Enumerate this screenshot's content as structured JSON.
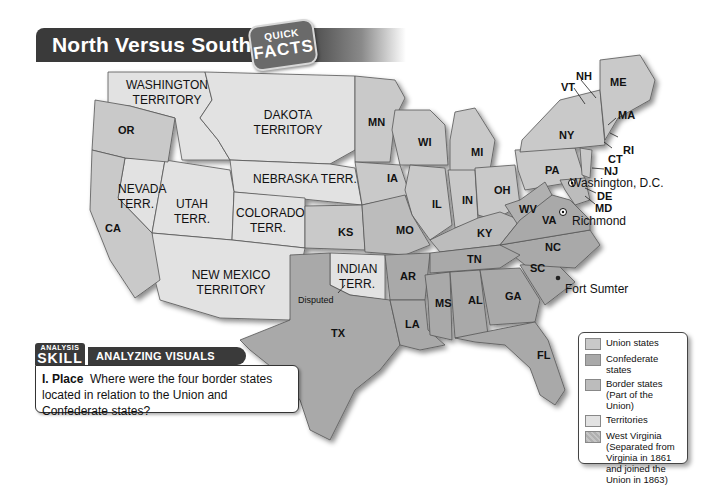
{
  "header": {
    "title": "North Versus South",
    "badge_top": "QUICK",
    "badge_bottom": "FACTS"
  },
  "colors": {
    "union": "#c9c9c9",
    "confederate": "#a9a9a9",
    "border_states": "#bcbcbc",
    "territories": "#e2e2e2",
    "west_virginia": "#b0b0b0",
    "title_bar": "#3a3a3a"
  },
  "map": {
    "territories": [
      {
        "label_line1": "WASHINGTON",
        "label_line2": "TERRITORY"
      },
      {
        "label_line1": "DAKOTA",
        "label_line2": "TERRITORY"
      },
      {
        "label_line1": "NEBRASKA TERR.",
        "label_line2": ""
      },
      {
        "label_line1": "NEVADA",
        "label_line2": "TERR."
      },
      {
        "label_line1": "UTAH",
        "label_line2": "TERR."
      },
      {
        "label_line1": "COLORADO",
        "label_line2": "TERR."
      },
      {
        "label_line1": "NEW MEXICO",
        "label_line2": "TERRITORY"
      },
      {
        "label_line1": "INDIAN",
        "label_line2": "TERR."
      }
    ],
    "states": {
      "OR": "OR",
      "CA": "CA",
      "MN": "MN",
      "WI": "WI",
      "MI": "MI",
      "IA": "IA",
      "KS": "KS",
      "MO": "MO",
      "IL": "IL",
      "IN": "IN",
      "OH": "OH",
      "PA": "PA",
      "NY": "NY",
      "KY": "KY",
      "WV": "WV",
      "VA": "VA",
      "NC": "NC",
      "TN": "TN",
      "SC": "SC",
      "GA": "GA",
      "AL": "AL",
      "MS": "MS",
      "AR": "AR",
      "LA": "LA",
      "TX": "TX",
      "FL": "FL",
      "ME": "ME",
      "NH": "NH",
      "VT": "VT",
      "MA": "MA",
      "RI": "RI",
      "CT": "CT",
      "NJ": "NJ",
      "DE": "DE",
      "MD": "MD"
    },
    "places": {
      "washington_dc": "Washington, D.C.",
      "richmond": "Richmond",
      "fort_sumter": "Fort Sumter",
      "disputed": "Disputed"
    }
  },
  "legend": {
    "items": [
      {
        "label": "Union states"
      },
      {
        "label": "Confederate states"
      },
      {
        "label": "Border states (Part of the Union)"
      },
      {
        "label": "Territories"
      },
      {
        "label": "West Virginia (Separated from Virginia in 1861 and joined the Union in 1863)"
      }
    ]
  },
  "skill_box": {
    "tag_top": "ANALYSIS",
    "tag_main": "SKILL",
    "heading": "ANALYZING VISUALS",
    "question_label": "I. Place",
    "question_text": "Where were the four border states located in relation to the Union and Confederate states?"
  }
}
